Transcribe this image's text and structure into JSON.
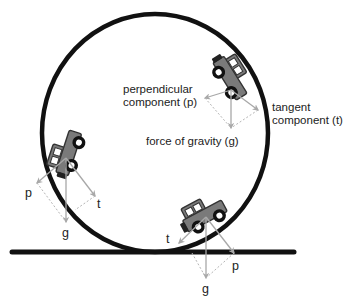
{
  "diagram": {
    "colors": {
      "track": "#111111",
      "car_body": "#7a7a7a",
      "car_outline": "#333333",
      "arrow": "#a8a8a8",
      "dashed": "#b5b5b5",
      "text": "#222222"
    },
    "labels": {
      "top_car": {
        "perpendicular_line1": "perpendicular",
        "perpendicular_line2": "component (p)",
        "tangent_line1": "tangent",
        "tangent_line2": "component (t)",
        "gravity": "force of gravity (g)"
      },
      "left_car": {
        "p": "p",
        "g": "g",
        "t": "t"
      },
      "bottom_car": {
        "p": "p",
        "g": "g",
        "t": "t"
      }
    },
    "elements": [
      "loop-track",
      "ground-line",
      "car-upper-right",
      "car-left",
      "car-bottom"
    ]
  }
}
